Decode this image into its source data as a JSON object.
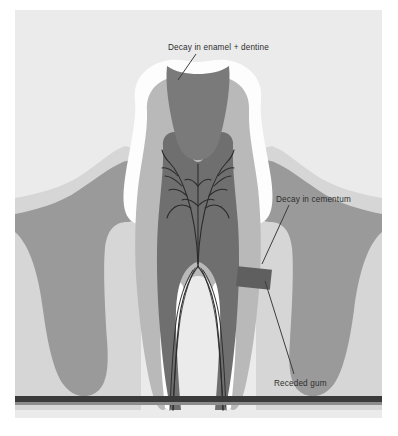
{
  "figure": {
    "kind": "dental-cross-section-diagram",
    "partial_top_text": "",
    "palette": {
      "page_background": "#ffffff",
      "panel_background": "#ebebeb",
      "enamel": "#fdfdfd",
      "dentine": "#b9b9b9",
      "pulp": "#6f6f6f",
      "nerve_lines": "#2b2b2b",
      "decay_enamel_dentine": "#7a7a7a",
      "decay_cementum": "#5f5f5f",
      "gum": "#9a9a9a",
      "gum_highlight": "#d2d2d2",
      "bone_bar": "#3a3a3a",
      "label_text": "#2e2e2e",
      "leader_line": "#3d3d3d"
    }
  },
  "labels": [
    {
      "id": "decay-enamel-dentine",
      "text": "Decay in enamel + dentine",
      "x": 168,
      "y": 44,
      "leader": {
        "x1": 196,
        "y1": 54,
        "x2": 178,
        "y2": 80
      }
    },
    {
      "id": "decay-cementum",
      "text": "Decay in cementum",
      "x": 276,
      "y": 196,
      "leader": {
        "x1": 289,
        "y1": 205,
        "x2": 262,
        "y2": 264
      }
    },
    {
      "id": "receded-gum",
      "text": "Receded gum",
      "x": 274,
      "y": 380,
      "leader": {
        "x1": 294,
        "y1": 374,
        "x2": 265,
        "y2": 281
      }
    }
  ],
  "anatomy": [
    {
      "id": "enamel-crown",
      "label": "Enamel"
    },
    {
      "id": "dentine-layer",
      "label": "Dentine"
    },
    {
      "id": "pulp-chamber",
      "label": "Pulp chamber"
    },
    {
      "id": "nerve-branches",
      "label": "Nerve and vessel branches"
    },
    {
      "id": "root-canal-left",
      "label": "Left root canal"
    },
    {
      "id": "root-canal-right",
      "label": "Right root canal"
    },
    {
      "id": "decay-wedge",
      "label": "Occlusal decay lesion"
    },
    {
      "id": "cementum-lesion",
      "label": "Cementum decay lesion"
    },
    {
      "id": "gum-left",
      "label": "Left receded gum"
    },
    {
      "id": "gum-right",
      "label": "Right receded gum"
    },
    {
      "id": "bone-baseline",
      "label": "Alveolar bone line"
    }
  ]
}
